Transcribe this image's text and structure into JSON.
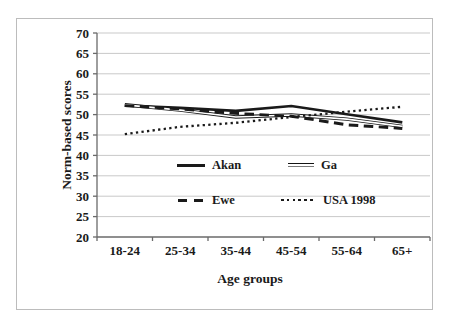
{
  "figure": {
    "background": "#ffffff",
    "border_color": "#bcbcbc",
    "axis_color": "#6a6a6a",
    "text_color": "#1a1a1a",
    "gridline_color": "#c9c9c9"
  },
  "chart_data": {
    "type": "line",
    "title": "",
    "xlabel": "Age groups",
    "ylabel": "Norm-based scores",
    "categories": [
      "18-24",
      "25-34",
      "35-44",
      "45-54",
      "55-64",
      "65+"
    ],
    "ylim": [
      20,
      70
    ],
    "yticks": [
      20,
      25,
      30,
      35,
      40,
      45,
      50,
      55,
      60,
      65,
      70
    ],
    "grid": "horizontal",
    "legend_position": "inside-bottom-left",
    "series": [
      {
        "name": "Akan",
        "line_style": "solid-thick",
        "color": "#1a1a1a",
        "values": [
          52.2,
          51.7,
          50.9,
          52.1,
          50.1,
          48.1
        ]
      },
      {
        "name": "Ga",
        "line_style": "double-thin",
        "color": "#1a1a1a",
        "values": [
          52.4,
          51.1,
          49.4,
          49.9,
          48.9,
          47.1
        ]
      },
      {
        "name": "Ewe",
        "line_style": "dashed-thick",
        "color": "#1a1a1a",
        "values": [
          52.2,
          51.4,
          50.3,
          49.6,
          47.5,
          46.6
        ]
      },
      {
        "name": "USA 1998",
        "line_style": "dotted",
        "color": "#1a1a1a",
        "values": [
          45.2,
          47.0,
          48.0,
          49.4,
          50.7,
          51.9
        ]
      }
    ]
  }
}
